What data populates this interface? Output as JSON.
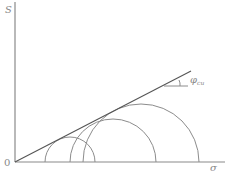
{
  "diagram": {
    "title": "",
    "labels": {
      "y_axis": "S",
      "x_axis": "σ",
      "origin": "0",
      "angle_symbol": "φ",
      "angle_subscript": "cu"
    },
    "colors": {
      "axis": "#8a8a8a",
      "envelope": "#555555",
      "circles": "#8c8c8c",
      "text": "#888888"
    },
    "geometry": {
      "origin": [
        15,
        162
      ],
      "x_axis_end": 225,
      "y_axis_top": 2,
      "envelope_end": [
        191,
        71
      ],
      "angle_ref_line": [
        [
          165,
          86
        ],
        [
          188,
          86
        ]
      ],
      "mohr_circles": [
        {
          "center_x": 70,
          "radius": 25
        },
        {
          "center_x": 113,
          "radius": 43
        },
        {
          "center_x": 141,
          "radius": 58
        }
      ]
    }
  }
}
